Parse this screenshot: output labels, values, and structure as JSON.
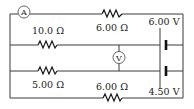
{
  "diagram": {
    "type": "circuit",
    "ammeter": {
      "label": "A"
    },
    "voltmeter": {
      "label": "V"
    },
    "resistors": [
      {
        "id": "r_top",
        "label": "6.00 Ω"
      },
      {
        "id": "r_mid_upper",
        "label": "10.0 Ω"
      },
      {
        "id": "r_mid_lower",
        "label": "5.00 Ω"
      },
      {
        "id": "r_bottom",
        "label": "6.00 Ω"
      }
    ],
    "batteries": [
      {
        "id": "bat_upper",
        "label": "6.00 V"
      },
      {
        "id": "bat_lower",
        "label": "4.50 V"
      }
    ]
  }
}
